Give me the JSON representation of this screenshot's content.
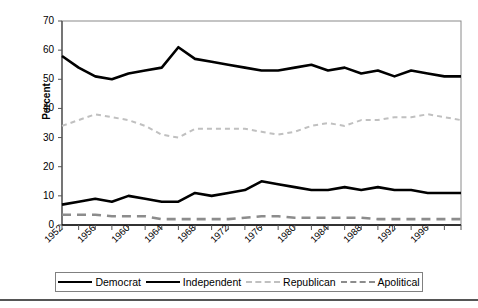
{
  "chart_data": {
    "type": "line",
    "title": "",
    "xlabel": "",
    "ylabel": "Percent",
    "ylim": [
      0,
      70
    ],
    "xlim": [
      1952,
      2000
    ],
    "yticks": [
      0,
      10,
      20,
      30,
      40,
      50,
      60,
      70
    ],
    "xticks": [
      1952,
      1954,
      1956,
      1958,
      1960,
      1962,
      1964,
      1966,
      1968,
      1970,
      1972,
      1974,
      1976,
      1978,
      1980,
      1982,
      1984,
      1986,
      1988,
      1990,
      1992,
      1994,
      1996,
      1998,
      2000
    ],
    "xtick_labels": [
      "1952",
      "1956",
      "1960",
      "1964",
      "1968",
      "1972",
      "1976",
      "1980",
      "1984",
      "1988",
      "1992",
      "1996"
    ],
    "xtick_label_years": [
      1952,
      1956,
      1960,
      1964,
      1968,
      1972,
      1976,
      1980,
      1984,
      1988,
      1992,
      1996
    ],
    "grid": false,
    "legend_position": "bottom",
    "x": [
      1952,
      1954,
      1956,
      1958,
      1960,
      1962,
      1964,
      1966,
      1968,
      1970,
      1972,
      1974,
      1976,
      1978,
      1980,
      1982,
      1984,
      1986,
      1988,
      1990,
      1992,
      1994,
      1996,
      1998,
      2000
    ],
    "series": [
      {
        "name": "Democrat",
        "color": "#000000",
        "style": "solid",
        "width": 2.6,
        "values": [
          58,
          54,
          51,
          50,
          52,
          53,
          54,
          61,
          57,
          56,
          55,
          54,
          53,
          53,
          54,
          55,
          53,
          54,
          52,
          53,
          51,
          53,
          52,
          51,
          51
        ]
      },
      {
        "name": "Independent",
        "color": "#000000",
        "style": "solid",
        "width": 2.6,
        "values": [
          7,
          8,
          9,
          8,
          10,
          9,
          8,
          8,
          11,
          10,
          11,
          12,
          15,
          14,
          13,
          12,
          12,
          13,
          12,
          13,
          12,
          12,
          11,
          11,
          11
        ]
      },
      {
        "name": "Republican",
        "color": "#c0c0c0",
        "style": "dotted",
        "width": 2.0,
        "values": [
          34,
          36,
          38,
          37,
          36,
          34,
          31,
          30,
          33,
          33,
          33,
          33,
          32,
          31,
          32,
          34,
          35,
          34,
          36,
          36,
          37,
          37,
          38,
          37,
          36
        ]
      },
      {
        "name": "Apolitical",
        "color": "#8c8c8c",
        "style": "dashed",
        "width": 2.6,
        "values": [
          3.5,
          3.5,
          3.5,
          3,
          3,
          3,
          2,
          2,
          2,
          2,
          2,
          2.5,
          3,
          3,
          2.5,
          2.5,
          2.5,
          2.5,
          2.5,
          2,
          2,
          2,
          2,
          2,
          2
        ]
      }
    ]
  },
  "axis": {
    "ylabel": "Percent",
    "ytick_labels": [
      "70",
      "60",
      "50",
      "40",
      "30",
      "20",
      "10",
      "0"
    ]
  },
  "legend": {
    "items": [
      {
        "label": "Democrat",
        "swatch": "solid-black"
      },
      {
        "label": "Independent",
        "swatch": "solid-black"
      },
      {
        "label": "Republican",
        "swatch": "dotted-lightgray"
      },
      {
        "label": "Apolitical",
        "swatch": "dashed-gray"
      }
    ]
  }
}
